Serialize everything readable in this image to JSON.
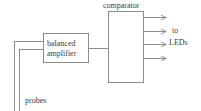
{
  "diagram": {
    "type": "block-diagram",
    "title": "",
    "width": 201,
    "height": 111,
    "background_color": "#ffffff",
    "line_color": "#8c8c8c",
    "text_color": "#3a3a3a",
    "blocks": [
      {
        "id": "balanced-amplifier",
        "label_line1": "balanced",
        "label_line2": "amplifier",
        "x": 43,
        "y": 33,
        "w": 45,
        "h": 29
      },
      {
        "id": "comparator",
        "label": "comparator",
        "x": 108,
        "y": 11,
        "w": 35,
        "h": 71
      }
    ],
    "labels": {
      "comparator": "comparator",
      "balanced": "balanced",
      "amplifier": "amplifier",
      "to": "to",
      "leds": "LEDs",
      "probes": "probes"
    },
    "outputs": {
      "count": 4,
      "destination": "to LEDs",
      "arrow_y": [
        17,
        31,
        44,
        58
      ]
    },
    "inputs": {
      "count": 2,
      "source": "probes",
      "wire_y": [
        41,
        49
      ]
    }
  }
}
